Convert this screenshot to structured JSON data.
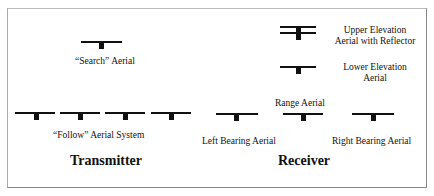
{
  "diagram": {
    "labels": {
      "search": "“Search” Aerial",
      "upper_line1": "Upper Elevation",
      "upper_line2": "Aerial with Reflector",
      "lower_line1": "Lower Elevation",
      "lower_line2": "Aerial",
      "range": "Range Aerial",
      "follow": "“Follow” Aerial System",
      "left_bearing": "Left Bearing Aerial",
      "right_bearing": "Right Bearing Aerial"
    },
    "sections": {
      "transmitter": "Transmitter",
      "receiver": "Receiver"
    }
  }
}
